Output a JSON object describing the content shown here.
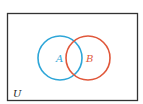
{
  "diagram": {
    "type": "venn",
    "universe_label": "U",
    "sets": [
      {
        "label": "A",
        "color": "#2ea6d8"
      },
      {
        "label": "B",
        "color": "#e0573a"
      }
    ],
    "border_color": "#333333"
  }
}
